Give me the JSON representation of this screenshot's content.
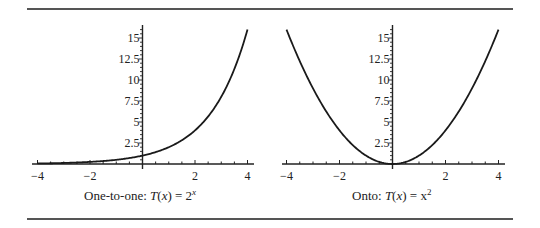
{
  "figure": {
    "left": {
      "caption_prefix": "One-to-one: ",
      "caption_fn": "T",
      "caption_var": "x",
      "caption_eq": " = 2",
      "caption_sup": "x"
    },
    "right": {
      "caption_prefix": "Onto: ",
      "caption_fn": "T",
      "caption_var": "x",
      "caption_eq": " = x",
      "caption_sup": "2"
    }
  },
  "chart_data": [
    {
      "type": "line",
      "title": "One-to-one: T(x) = 2^x",
      "function": "2^x",
      "xlabel": "",
      "ylabel": "",
      "xlim": [
        -4,
        4
      ],
      "ylim": [
        0,
        16
      ],
      "x_ticks": [
        -4,
        -2,
        2,
        4
      ],
      "x_tick_labels": [
        "−4",
        "−2",
        "2",
        "4"
      ],
      "y_ticks": [
        2.5,
        5,
        7.5,
        10,
        12.5,
        15
      ],
      "y_tick_labels": [
        "2.5",
        "5",
        "7.5",
        "10",
        "12.5",
        "15"
      ],
      "x": [
        -4,
        -3,
        -2,
        -1,
        0,
        1,
        2,
        3,
        4
      ],
      "values": [
        0.0625,
        0.125,
        0.25,
        0.5,
        1,
        2,
        4,
        8,
        16
      ],
      "grid": false,
      "legend": null
    },
    {
      "type": "line",
      "title": "Onto: T(x) = x^2",
      "function": "x^2",
      "xlabel": "",
      "ylabel": "",
      "xlim": [
        -4,
        4
      ],
      "ylim": [
        0,
        16
      ],
      "x_ticks": [
        -4,
        -2,
        2,
        4
      ],
      "x_tick_labels": [
        "−4",
        "−2",
        "2",
        "4"
      ],
      "y_ticks": [
        2.5,
        5,
        7.5,
        10,
        12.5,
        15
      ],
      "y_tick_labels": [
        "2.5",
        "5",
        "7.5",
        "10",
        "12.5",
        "15"
      ],
      "x": [
        -4,
        -3,
        -2,
        -1,
        0,
        1,
        2,
        3,
        4
      ],
      "values": [
        16,
        9,
        4,
        1,
        0,
        1,
        4,
        9,
        16
      ],
      "grid": false,
      "legend": null
    }
  ]
}
